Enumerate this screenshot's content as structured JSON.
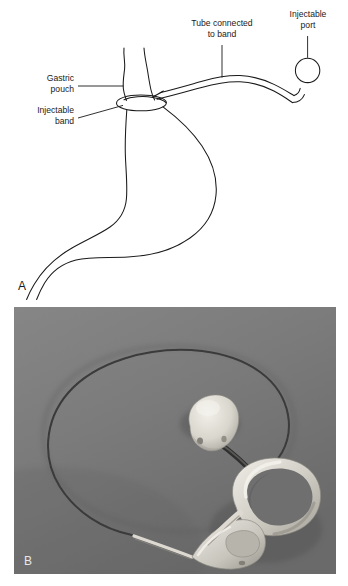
{
  "figure": {
    "panels": [
      {
        "letter": "A",
        "type": "line-drawing",
        "description": "Schematic of adjustable gastric band placed around the upper stomach, with tube running to a subcutaneous injectable port",
        "labels": [
          {
            "id": "gastric-pouch",
            "text_line_1": "Gastric",
            "text_line_2": "pouch",
            "align": "right"
          },
          {
            "id": "injectable-band",
            "text_line_1": "Injectable",
            "text_line_2": "band",
            "align": "right"
          },
          {
            "id": "tube-connected-to-band",
            "text_line_1": "Tube connected",
            "text_line_2": "to band",
            "align": "center"
          },
          {
            "id": "injectable-port",
            "text_line_1": "Injectable",
            "text_line_2": "port",
            "align": "center"
          }
        ]
      },
      {
        "letter": "B",
        "type": "photograph",
        "description": "Grayscale photograph of the gastric band device: silicone band ring with buckle, connecting tube, and injection port"
      }
    ]
  },
  "colors": {
    "ink": "#1a1a1a",
    "paper": "#ffffff",
    "photo_background": "#7b7b7b",
    "photo_background_dark": "#6d6d6d",
    "device_white": "#e6e4de",
    "tube_dark": "#3c3c3c",
    "photo_letter": "#e8e8e8"
  }
}
